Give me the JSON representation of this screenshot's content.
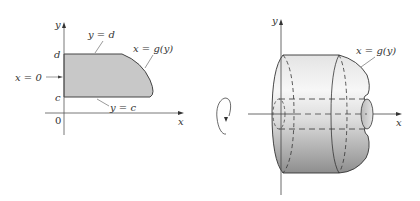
{
  "left_panel": {
    "axis_y_label": "y",
    "axis_x_label": "x",
    "origin_label": "0",
    "tick_d": "d",
    "tick_c": "c",
    "label_top": "y = d",
    "label_bottom": "y = c",
    "label_left": "x = 0",
    "label_curve": "x = g(y)",
    "region_fill": "#c8c8c8"
  },
  "right_panel": {
    "axis_y_label": "y",
    "axis_x_label": "x",
    "label_curve": "x = g(y)",
    "rotation_icon": "rotation-arrow-icon"
  },
  "colors": {
    "stroke": "#333333",
    "solid_light": "#f2f2f2",
    "solid_dark": "#9a9a9a"
  }
}
